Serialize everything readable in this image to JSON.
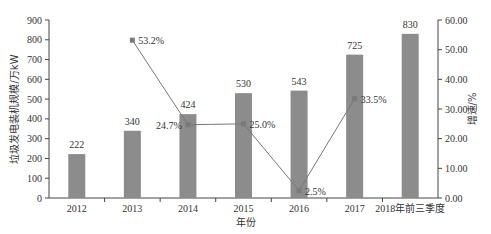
{
  "chart_data": {
    "type": "bar+line",
    "title": "",
    "categories": [
      "2012",
      "2013",
      "2014",
      "2015",
      "2016",
      "2017",
      "2018年前三季度"
    ],
    "xlabel": "年份",
    "ylabel": "垃圾发电装机规模/万kW",
    "y2label": "增速/%",
    "ylim": [
      0,
      900
    ],
    "y2lim": [
      0,
      60
    ],
    "yticks": [
      "0",
      "100",
      "200",
      "300",
      "400",
      "500",
      "600",
      "700",
      "800",
      "900"
    ],
    "y2ticks": [
      "0.00",
      "10.00",
      "20.00",
      "30.00",
      "40.00",
      "50.00",
      "60.00"
    ],
    "series": [
      {
        "name": "垃圾发电装机规模",
        "type": "bar",
        "axis": "left",
        "values": [
          222,
          340,
          424,
          530,
          543,
          725,
          830
        ],
        "labels": [
          "222",
          "340",
          "424",
          "530",
          "543",
          "725",
          "830"
        ]
      },
      {
        "name": "增速",
        "type": "line",
        "axis": "right",
        "values": [
          null,
          53.2,
          24.7,
          25.0,
          2.5,
          33.5,
          null
        ],
        "labels": [
          "",
          "53.2%",
          "24.7%",
          "25.0%",
          "2.5%",
          "33.5%",
          ""
        ]
      }
    ],
    "grid": false,
    "colors": {
      "bar": "#8c8c8c",
      "line": "#777777",
      "marker": "#7a7a7a",
      "axis": "#444444"
    }
  }
}
